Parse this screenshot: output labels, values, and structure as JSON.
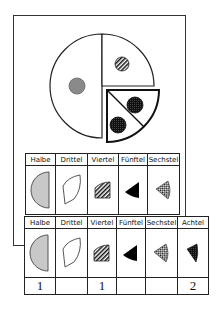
{
  "diagram": {
    "pie": {
      "segments": [
        {
          "name": "halbe",
          "fraction": "1/2",
          "marker": "gray-dot"
        },
        {
          "name": "viertel",
          "fraction": "1/4",
          "marker": "striped-dot"
        },
        {
          "name": "achtel",
          "fraction": "1/8",
          "marker": "checker-dot",
          "exploded": true
        },
        {
          "name": "achtel",
          "fraction": "1/8",
          "marker": "checker-dot",
          "exploded": true
        }
      ]
    },
    "table1": {
      "headers": [
        "Halbe",
        "Drittel",
        "Viertel",
        "Fünftel",
        "Sechstel"
      ],
      "icons": [
        "half-gray-icon",
        "third-outline-icon",
        "quarter-striped-icon",
        "fifth-black-icon",
        "sixth-checker-icon"
      ]
    },
    "table2": {
      "headers": [
        "Halbe",
        "Drittel",
        "Viertel",
        "Fünftel",
        "Sechstel",
        "Achtel"
      ],
      "icons": [
        "half-gray-icon",
        "third-outline-icon",
        "quarter-striped-icon",
        "fifth-black-icon",
        "sixth-checker-icon",
        "eighth-checker-icon"
      ],
      "values": [
        "1",
        "",
        "1",
        "",
        "",
        "2"
      ]
    },
    "colors": {
      "gray_fill": "#c8c8c8",
      "dot_gray": "#8a8a8a",
      "line": "#222222"
    }
  }
}
